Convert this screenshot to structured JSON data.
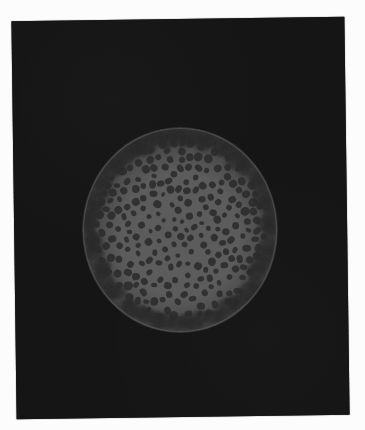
{
  "image": {
    "width": 365,
    "height": 430,
    "description": "Micrograph of a circular specimen with a dense pattern of dark spots on a lighter gray disc, surrounded by a bumpy darker rim and soft glow, on a black plate with white border"
  },
  "colors": {
    "page_background": "#fcfcfc",
    "plate": "#151515",
    "disc_center": "#5c5c5c",
    "disc_mid": "#4a4a4a",
    "rim": "#2f2f2f",
    "glow": "#4a4a4a",
    "spot": "#2c2c2c",
    "rim_cell": "#262626"
  },
  "specimen": {
    "cx": 180,
    "cy": 230,
    "rx": 98,
    "ry": 103,
    "spot_count": 230,
    "rim_cell_count": 60,
    "seed": 7
  }
}
